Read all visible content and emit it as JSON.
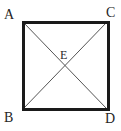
{
  "figure": {
    "kind": "geometry-diagram",
    "background_color": "#ffffff",
    "square": {
      "border_color": "#1a1a1a",
      "border_width_px": 3,
      "left_px": 22,
      "top_px": 21,
      "size_px": 88
    },
    "diagonals": {
      "color": "#555555",
      "width_px": 1,
      "segments": [
        "A-D",
        "C-B"
      ]
    },
    "vertices": [
      {
        "id": "A",
        "label": "A",
        "position": "top-left"
      },
      {
        "id": "C",
        "label": "C",
        "position": "top-right"
      },
      {
        "id": "B",
        "label": "B",
        "position": "bottom-left"
      },
      {
        "id": "D",
        "label": "D",
        "position": "bottom-right"
      }
    ],
    "center": {
      "id": "E",
      "label": "E",
      "position": "center"
    }
  }
}
